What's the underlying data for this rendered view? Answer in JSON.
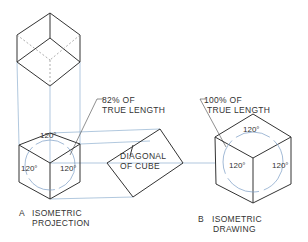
{
  "figure": {
    "type": "isometric projection vs isometric drawing",
    "panel_a": {
      "letter": "A",
      "caption_line1": "ISOMETRIC",
      "caption_line2": "PROJECTION",
      "length_note_line1": "82% OF",
      "length_note_line2": "TRUE LENGTH",
      "diagonal_label_line1": "DIAGONAL",
      "diagonal_label_line2": "OF CUBE",
      "angles": [
        "120°",
        "120°",
        "120°"
      ]
    },
    "panel_b": {
      "letter": "B",
      "caption_line1": "ISOMETRIC",
      "caption_line2": "DRAWING",
      "length_note_line1": "100% OF",
      "length_note_line2": "TRUE LENGTH",
      "angles": [
        "120°",
        "120°",
        "120°"
      ]
    },
    "colors": {
      "line": "#333333",
      "projection": "#8aa8c8",
      "arc": "#5b7fb0"
    }
  }
}
